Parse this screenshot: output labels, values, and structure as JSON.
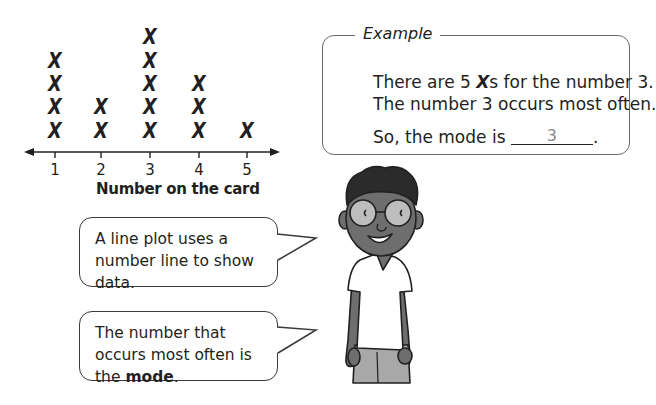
{
  "chart_data": {
    "type": "line_plot",
    "title": "",
    "xlabel": "Number on the card",
    "ylabel": "",
    "categories": [
      "1",
      "2",
      "3",
      "4",
      "5"
    ],
    "values": [
      4,
      2,
      5,
      3,
      1
    ],
    "marker": "X",
    "grid": false,
    "legend": null
  },
  "plot": {
    "axis_title": "Number on the card",
    "ticks": [
      "1",
      "2",
      "3",
      "4",
      "5"
    ],
    "marker_glyph": "X"
  },
  "example": {
    "label": "Example",
    "line1_pre": "There are 5 ",
    "line1_x": "X",
    "line1_post": "s for the number 3.",
    "line2": "The number 3 occurs most often.",
    "line3_pre": "So, the mode is ",
    "answer": "3",
    "line3_post": "."
  },
  "bubbles": [
    {
      "text": "A line plot uses a number line to show data."
    },
    {
      "text_pre": "The number that occurs most often is the ",
      "bold": "mode",
      "text_post": "."
    }
  ],
  "colors": {
    "ink": "#231f20",
    "answer": "#8a8a8a",
    "skin": "#6e6e6e",
    "shirt": "#ffffff",
    "pants": "#a8a8a8"
  }
}
